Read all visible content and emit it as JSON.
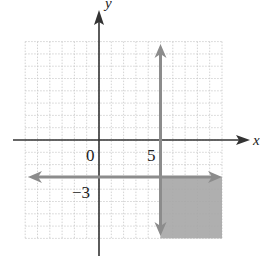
{
  "chart_data": {
    "type": "region",
    "title": "",
    "xlabel": "x",
    "ylabel": "y",
    "xlim": [
      -6,
      10
    ],
    "ylim": [
      -8,
      8
    ],
    "grid": true,
    "grid_step": 1,
    "tick_labels": [
      {
        "text": "0",
        "x": 0,
        "y": 0,
        "position": "below-left of origin"
      },
      {
        "text": "5",
        "x": 5,
        "y": 0,
        "position": "below-left of x=5"
      },
      {
        "text": "−3",
        "x": 0,
        "y": -3,
        "position": "below-left of y=-3"
      }
    ],
    "lines": [
      {
        "name": "x = 5",
        "orientation": "vertical",
        "value": 5,
        "arrows": "both"
      },
      {
        "name": "y = −3",
        "orientation": "horizontal",
        "value": -3,
        "arrows": "both"
      }
    ],
    "shaded_region": {
      "description": "x ≥ 5 and y ≤ −3",
      "x_range": [
        5,
        10
      ],
      "y_range": [
        -8,
        -3
      ],
      "color": "#a6a6a6"
    },
    "colors": {
      "axis": "#333333",
      "boundary_lines": "#8c8c8c",
      "grid": "#c8c8c8",
      "shade": "#a6a6a6"
    }
  },
  "labels": {
    "x_axis": "x",
    "y_axis": "y",
    "origin": "0",
    "five": "5",
    "neg_three": "−3"
  }
}
